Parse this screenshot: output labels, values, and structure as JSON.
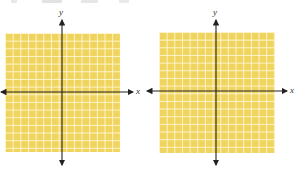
{
  "figure": {
    "colors": {
      "grid_fill": "#f0d460",
      "grid_lines": "#fffadc",
      "axis": "#222222"
    },
    "graphs": [
      {
        "x_label": "x",
        "y_label": "y",
        "grid_cells": 15
      },
      {
        "x_label": "x",
        "y_label": "y",
        "grid_cells": 15
      }
    ]
  }
}
